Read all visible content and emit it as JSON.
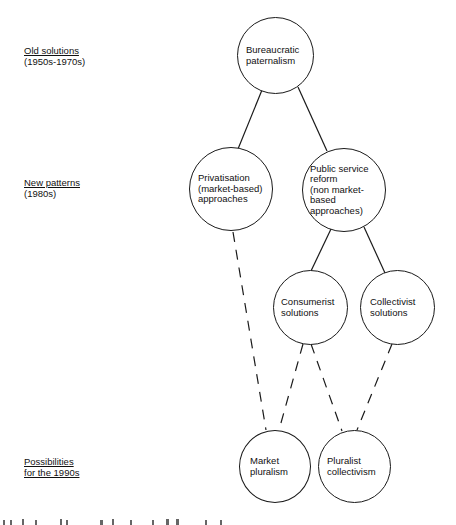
{
  "diagram": {
    "type": "tree-flow",
    "colors": {
      "ink": "#111111",
      "background": "#ffffff"
    },
    "eras": [
      {
        "id": "old",
        "title": "Old solutions",
        "subtitle": "(1950s-1970s)",
        "subtitle_underlined": false
      },
      {
        "id": "new",
        "title": "New patterns",
        "subtitle": "(1980s)",
        "subtitle_underlined": false
      },
      {
        "id": "future",
        "title": "Possibilities",
        "subtitle": "for the 1990s",
        "subtitle_underlined": true
      }
    ],
    "nodes": [
      {
        "id": "bureaucratic",
        "label": "Bureaucratic\npaternalism",
        "era": "old"
      },
      {
        "id": "privatisation",
        "label": "Privatisation\n(market-based)\napproaches",
        "era": "new"
      },
      {
        "id": "public_reform",
        "label": "Public service\nreform\n(non market-\nbased\napproaches)",
        "era": "new"
      },
      {
        "id": "consumerist",
        "label": "Consumerist\nsolutions",
        "era": "new"
      },
      {
        "id": "collectivist",
        "label": "Collectivist\nsolutions",
        "era": "new"
      },
      {
        "id": "market_pluralism",
        "label": "Market\npluralism",
        "era": "future"
      },
      {
        "id": "pluralist_collectivism",
        "label": "Pluralist\ncollectivism",
        "era": "future"
      }
    ],
    "edges": [
      {
        "from": "bureaucratic",
        "to": "privatisation",
        "style": "solid"
      },
      {
        "from": "bureaucratic",
        "to": "public_reform",
        "style": "solid"
      },
      {
        "from": "public_reform",
        "to": "consumerist",
        "style": "solid"
      },
      {
        "from": "public_reform",
        "to": "collectivist",
        "style": "solid"
      },
      {
        "from": "privatisation",
        "to": "market_pluralism",
        "style": "dashed"
      },
      {
        "from": "consumerist",
        "to": "market_pluralism",
        "style": "dashed"
      },
      {
        "from": "consumerist",
        "to": "pluralist_collectivism",
        "style": "dashed"
      },
      {
        "from": "collectivist",
        "to": "pluralist_collectivism",
        "style": "dashed"
      }
    ]
  }
}
